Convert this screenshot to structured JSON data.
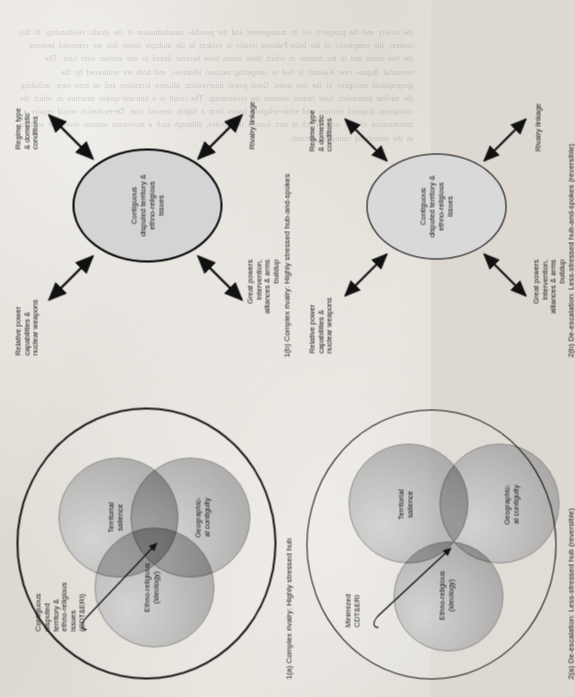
{
  "figure": {
    "colors": {
      "page_background": "#ddd9d2",
      "circle_fill": "#b4b4b4",
      "hub_fill": "#d4d4d4",
      "outline": "#1a1a1a",
      "text": "#111111"
    }
  },
  "panels": [
    {
      "id": "1a",
      "type": "venn",
      "caption": "1(a) Complex rivalry: Highly stressed hub",
      "hub_label": "Contiguous\ndisputed\nterritory &\nethno-religious\nissues\n(CDT&ERI)",
      "circles": [
        {
          "name": "ethno-religious",
          "label": "Ethno-religious\n(ideology)"
        },
        {
          "name": "territorial-salience",
          "label": "Territorial\nsalience"
        },
        {
          "name": "geographical-contiguity",
          "label": "Geographic-\nal contiguity"
        }
      ]
    },
    {
      "id": "1b",
      "type": "hub-and-spokes",
      "caption": "1(b) Complex rivalry: Highly stressed hub-and-spokes",
      "hub_label": "Contiguous\ndisputed territory &\nethno-religious\nissues",
      "spokes": [
        {
          "name": "relative-power",
          "label": "Relative power\ncapabilities &\nnuclear weapons"
        },
        {
          "name": "regime-type",
          "label": "Regime type\n& domestic\nconditions"
        },
        {
          "name": "great-powers",
          "label": "Great powers\nintervention,\nalliances & arms\nbuildup"
        },
        {
          "name": "rivalry-linkage",
          "label": "Rivalry linkage"
        }
      ]
    },
    {
      "id": "2a",
      "type": "venn",
      "caption": "2(a) De-escalation: Less-stressed hub (reversible)",
      "hub_label": "Minimized\nCDT&ERI",
      "circles": [
        {
          "name": "ethno-religious",
          "label": "Ethno-religious\n(ideology)"
        },
        {
          "name": "territorial-salience",
          "label": "Territorial\nsalience"
        },
        {
          "name": "geographical-contiguity",
          "label": "Geographic-\nal contiguity"
        }
      ]
    },
    {
      "id": "2b",
      "type": "hub-and-spokes",
      "caption": "2(b) De-escalation: Less-stressed hub-and-spokes (reversible)",
      "hub_label": "Contiguous\ndisputed territory &\nethno-religious\nissues",
      "spokes": [
        {
          "name": "relative-power",
          "label": "Relative power\ncapabilities &\nnuclear weapons"
        },
        {
          "name": "regime-type",
          "label": "Regime type\n& domestic\nconditions"
        },
        {
          "name": "great-powers",
          "label": "Great powers\nintervention,\nalliances & arms\nbuildup"
        },
        {
          "name": "rivalry-linkage",
          "label": "Rivalry linkage"
        }
      ]
    }
  ],
  "background_text": "the rivalry and the prospects for its management and the possible transformation of the dyadic relationship. In this context, the complexity of the India-Pakistan rivalry is evident in the multiple issues that are contested between the two states and in the manner in which these issues have become linked to one another over time. The territorial dispute over Kashmir is tied to competing national identities, and both are reinforced by the geographical contiguity of the two states. Great power intervention, alliance formation and an arms race, including the nuclear dimension, have further stressed the relationship. The result is a hub-and-spokes structure in which the contiguous disputed territory and ethno-religious issues form a highly stressed core. De-escalation would require a minimization of that core, which in turn loosens the spokes, although such a movement remains reversible so long as the underlying contiguity persists."
}
